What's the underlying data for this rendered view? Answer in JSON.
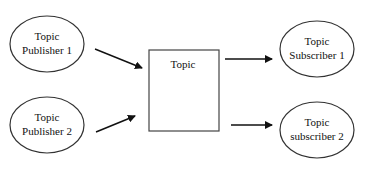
{
  "diagram": {
    "type": "publish-subscribe",
    "nodes": [
      {
        "id": "pub1",
        "shape": "ellipse",
        "line1": "Topic",
        "line2": "Publisher 1"
      },
      {
        "id": "pub2",
        "shape": "ellipse",
        "line1": "Topic",
        "line2": "Publisher 2"
      },
      {
        "id": "topic",
        "shape": "rectangle",
        "label": "Topic"
      },
      {
        "id": "sub1",
        "shape": "ellipse",
        "line1": "Topic",
        "line2": "Subscriber 1"
      },
      {
        "id": "sub2",
        "shape": "ellipse",
        "line1": "Topic",
        "line2": "subscriber 2"
      }
    ],
    "edges": [
      {
        "from": "pub1",
        "to": "topic"
      },
      {
        "from": "pub2",
        "to": "topic"
      },
      {
        "from": "topic",
        "to": "sub1"
      },
      {
        "from": "topic",
        "to": "sub2"
      }
    ],
    "colors": {
      "stroke": "#333333",
      "arrow": "#111111",
      "background": "#ffffff"
    }
  }
}
